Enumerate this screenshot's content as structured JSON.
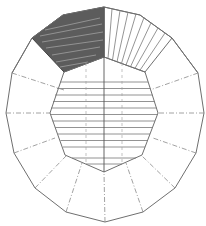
{
  "diagram": {
    "type": "pattern development drawing",
    "colors": {
      "background": "#ffffff",
      "line": "#6f6f6f",
      "shaded_panel": "#5a5a5a",
      "fold_line": "#8a8a8a"
    },
    "outer_polygon": [
      [
        63,
        15
      ],
      [
        104,
        7
      ],
      [
        140,
        15
      ],
      [
        172,
        38
      ],
      [
        198,
        73
      ],
      [
        204,
        113
      ],
      [
        196,
        153
      ],
      [
        175,
        188
      ],
      [
        143,
        212
      ],
      [
        105,
        222
      ],
      [
        66,
        212
      ],
      [
        35,
        188
      ],
      [
        14,
        153
      ],
      [
        6,
        113
      ],
      [
        12,
        73
      ],
      [
        32,
        38
      ]
    ],
    "inner_octagon": [
      [
        104,
        57
      ],
      [
        145,
        72
      ],
      [
        158,
        113
      ],
      [
        142,
        155
      ],
      [
        104,
        172
      ],
      [
        65,
        155
      ],
      [
        50,
        113
      ],
      [
        64,
        72
      ]
    ],
    "shaded_panel": [
      [
        32,
        38
      ],
      [
        63,
        15
      ],
      [
        104,
        7
      ],
      [
        104,
        57
      ],
      [
        64,
        72
      ]
    ],
    "striped_panel": [
      [
        104,
        7
      ],
      [
        140,
        15
      ],
      [
        172,
        38
      ],
      [
        145,
        72
      ],
      [
        104,
        57
      ]
    ],
    "fold_lines": [
      [
        [
          12,
          73
        ],
        [
          64,
          72
        ]
      ],
      [
        [
          6,
          113
        ],
        [
          50,
          113
        ]
      ],
      [
        [
          14,
          153
        ],
        [
          65,
          155
        ]
      ],
      [
        [
          35,
          188
        ],
        [
          65,
          155
        ]
      ],
      [
        [
          66,
          212
        ],
        [
          82,
          163
        ]
      ],
      [
        [
          105,
          222
        ],
        [
          104,
          172
        ]
      ],
      [
        [
          143,
          212
        ],
        [
          126,
          163
        ]
      ],
      [
        [
          175,
          188
        ],
        [
          142,
          155
        ]
      ],
      [
        [
          196,
          153
        ],
        [
          142,
          155
        ]
      ],
      [
        [
          204,
          113
        ],
        [
          158,
          113
        ]
      ],
      [
        [
          198,
          73
        ],
        [
          145,
          72
        ]
      ]
    ],
    "horizontal_stripe_count": 13,
    "radial_stripe_count": 9
  }
}
